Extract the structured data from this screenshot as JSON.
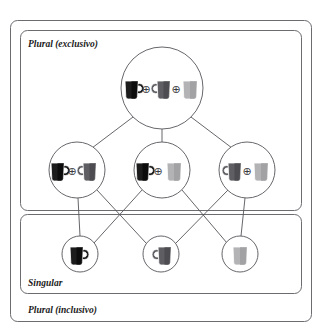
{
  "figure": {
    "title": "",
    "type": "semilattice-hasse-diagram",
    "background_color": "#ffffff",
    "line_color": "#55555a",
    "frame_color": "#6b6b70"
  },
  "regions": [
    {
      "id": "plural-exclusivo",
      "label": "Plural (exclusivo)",
      "label_x": 28,
      "label_y": 44,
      "x": 20,
      "y": 30,
      "width": 282,
      "height": 180,
      "radius": 7
    },
    {
      "id": "singular",
      "label": "Singular",
      "label_x": 28,
      "label_y": 285,
      "x": 20,
      "y": 214,
      "width": 282,
      "height": 80,
      "radius": 7
    },
    {
      "id": "plural-inclusivo",
      "label": "Plural (inclusivo)",
      "label_x": 28,
      "label_y": 313,
      "x": 10,
      "y": 20,
      "width": 302,
      "height": 302,
      "radius": 7
    }
  ],
  "mug_colors": {
    "black": "#1c1c1c",
    "black_shade": "#000000",
    "dark_gray": "#5e5e63",
    "dark_gray_shade": "#3f3f44",
    "light_gray": "#b3b3b6",
    "light_gray_shade": "#949498",
    "outline": "#ffffff"
  },
  "operator_symbol": "⊕",
  "nodes": [
    {
      "id": "node-abc",
      "level": "plural-exclusivo-top",
      "cx": 162,
      "cy": 88,
      "r": 41,
      "mugs": [
        "black",
        "dark_gray",
        "light_gray"
      ],
      "label": "a ⊕ b ⊕ c"
    },
    {
      "id": "node-ab",
      "level": "plural-exclusivo-middle",
      "cx": 77,
      "cy": 170,
      "r": 28,
      "mugs": [
        "black",
        "dark_gray"
      ],
      "label": "a ⊕ b"
    },
    {
      "id": "node-ac",
      "level": "plural-exclusivo-middle",
      "cx": 162,
      "cy": 170,
      "r": 28,
      "mugs": [
        "black",
        "light_gray"
      ],
      "label": "a ⊕ c"
    },
    {
      "id": "node-bc",
      "level": "plural-exclusivo-middle",
      "cx": 247,
      "cy": 170,
      "r": 28,
      "mugs": [
        "dark_gray",
        "light_gray"
      ],
      "label": "b ⊕ c"
    },
    {
      "id": "node-a",
      "level": "singular",
      "cx": 80,
      "cy": 254,
      "r": 18,
      "mugs": [
        "black"
      ],
      "label": "a"
    },
    {
      "id": "node-b",
      "level": "singular",
      "cx": 161,
      "cy": 254,
      "r": 18,
      "mugs": [
        "dark_gray"
      ],
      "label": "b"
    },
    {
      "id": "node-c",
      "level": "singular",
      "cx": 240,
      "cy": 254,
      "r": 18,
      "mugs": [
        "light_gray"
      ],
      "label": "c"
    }
  ],
  "edges": [
    {
      "from": "node-abc",
      "to": "node-ab"
    },
    {
      "from": "node-abc",
      "to": "node-ac"
    },
    {
      "from": "node-abc",
      "to": "node-bc"
    },
    {
      "from": "node-ab",
      "to": "node-a"
    },
    {
      "from": "node-ab",
      "to": "node-b"
    },
    {
      "from": "node-ac",
      "to": "node-a"
    },
    {
      "from": "node-ac",
      "to": "node-c"
    },
    {
      "from": "node-bc",
      "to": "node-b"
    },
    {
      "from": "node-bc",
      "to": "node-c"
    }
  ]
}
